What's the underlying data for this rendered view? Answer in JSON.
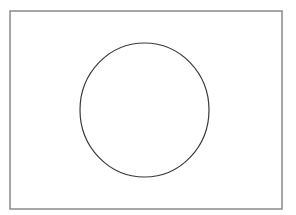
{
  "diagram": {
    "frame": {
      "x": 10,
      "y": 11,
      "width": 272,
      "height": 198,
      "stroke": "#8a8a8a",
      "stroke_width": 1.5,
      "fill": "#ffffff"
    },
    "circle": {
      "cx": 144.5,
      "cy": 110,
      "rx": 64.5,
      "ry": 67,
      "stroke": "#3a3a3a",
      "stroke_width": 1.2,
      "fill": "none"
    }
  }
}
